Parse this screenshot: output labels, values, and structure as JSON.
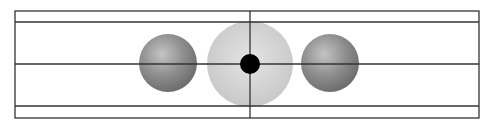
{
  "diagram": {
    "frame": {
      "x": 15,
      "y": 11,
      "width": 464,
      "height": 107,
      "stroke": "#333333"
    },
    "horizontal_lines_y": [
      22,
      64,
      106
    ],
    "vertical_line_x": 250,
    "spheres": [
      {
        "name": "left-sphere",
        "cx": 168,
        "cy": 63,
        "r": 29,
        "color": "#8a8a8a",
        "highlight": "#c8c8c8"
      },
      {
        "name": "center-sphere",
        "cx": 250,
        "cy": 64,
        "r": 43,
        "color": "#d0d0d0",
        "highlight": "#e6e6e6"
      },
      {
        "name": "right-sphere",
        "cx": 330,
        "cy": 63,
        "r": 29,
        "color": "#8a8a8a",
        "highlight": "#c8c8c8"
      }
    ],
    "central_dot": {
      "cx": 250,
      "cy": 64,
      "r": 10,
      "color": "#000000"
    }
  }
}
